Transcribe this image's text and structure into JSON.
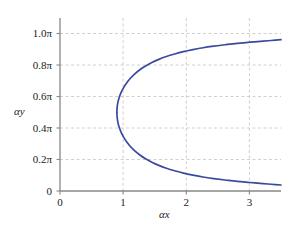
{
  "chart_data": {
    "type": "line",
    "title": "",
    "xlabel": "αx",
    "ylabel": "αy",
    "xlim": [
      0,
      3.5
    ],
    "ylim": [
      0,
      1.1
    ],
    "grid": true,
    "legend_position": "none",
    "line_color": "#3a4a9e",
    "grid_color": "#bfbfbf",
    "axis_color": "#808080",
    "xticks": [
      0,
      1,
      2,
      3
    ],
    "xtick_labels": [
      "0",
      "1",
      "2",
      "3"
    ],
    "yticks": [
      0,
      0.2,
      0.4,
      0.6,
      0.8,
      1.0
    ],
    "ytick_labels": [
      "0",
      "0.2π",
      "0.4π",
      "0.6π",
      "0.8π",
      "1.0π"
    ],
    "ytick_unit": "π",
    "vertex": {
      "x": 0.9,
      "y": 0.5
    },
    "series": [
      {
        "name": "upper-branch",
        "x": [
          0.9,
          0.905,
          0.915,
          0.935,
          0.965,
          1.005,
          1.055,
          1.115,
          1.185,
          1.265,
          1.355,
          1.455,
          1.565,
          1.685,
          1.815,
          1.955,
          2.105,
          2.265,
          2.435,
          2.615,
          2.805,
          3.005,
          3.215,
          3.345,
          3.5
        ],
        "y": [
          0.5,
          0.53,
          0.56,
          0.592,
          0.624,
          0.656,
          0.687,
          0.717,
          0.745,
          0.771,
          0.795,
          0.817,
          0.837,
          0.855,
          0.871,
          0.886,
          0.899,
          0.911,
          0.921,
          0.93,
          0.939,
          0.946,
          0.953,
          0.957,
          0.962
        ]
      },
      {
        "name": "lower-branch",
        "x": [
          0.9,
          0.905,
          0.915,
          0.935,
          0.965,
          1.005,
          1.055,
          1.115,
          1.185,
          1.265,
          1.355,
          1.455,
          1.565,
          1.685,
          1.815,
          1.955,
          2.105,
          2.265,
          2.435,
          2.615,
          2.805,
          3.005,
          3.215,
          3.345,
          3.5
        ],
        "y": [
          0.5,
          0.47,
          0.44,
          0.408,
          0.376,
          0.344,
          0.313,
          0.283,
          0.255,
          0.229,
          0.205,
          0.183,
          0.163,
          0.145,
          0.129,
          0.114,
          0.101,
          0.089,
          0.079,
          0.07,
          0.061,
          0.054,
          0.047,
          0.043,
          0.038
        ]
      }
    ]
  },
  "axes": {
    "x_title": "αx",
    "y_title": "αy"
  },
  "ticks": {
    "y": [
      {
        "label": "1.0π"
      },
      {
        "label": "0.8π"
      },
      {
        "label": "0.6π"
      },
      {
        "label": "0.4π"
      },
      {
        "label": "0.2π"
      },
      {
        "label": "0"
      }
    ],
    "x": [
      {
        "label": "0"
      },
      {
        "label": "1"
      },
      {
        "label": "2"
      },
      {
        "label": "3"
      }
    ]
  }
}
